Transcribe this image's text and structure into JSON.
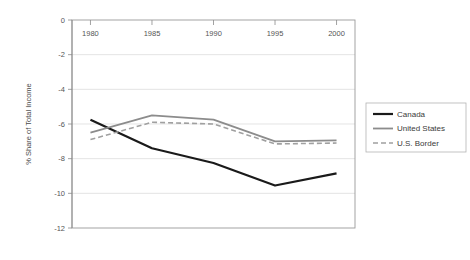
{
  "chart_data": {
    "type": "line",
    "title": "",
    "xlabel": "",
    "ylabel": "% Share of Total Income",
    "x": [
      1980,
      1985,
      1990,
      1995,
      2000
    ],
    "xtick_labels": [
      "1980",
      "1985",
      "1990",
      "1995",
      "2000"
    ],
    "ytick_labels": [
      "0",
      "-2",
      "-4",
      "-6",
      "-8",
      "-10",
      "-12"
    ],
    "ytick_values": [
      0,
      -2,
      -4,
      -6,
      -8,
      -10,
      -12
    ],
    "ylim": [
      -12,
      0
    ],
    "xlim": [
      1978.5,
      2001.5
    ],
    "grid": "horizontal",
    "legend_position": "right",
    "series": [
      {
        "name": "Canada",
        "values": [
          -5.75,
          -7.4,
          -8.25,
          -9.55,
          -8.85
        ],
        "color": "#1a1a1a",
        "style": "solid",
        "width": 2.2
      },
      {
        "name": "United States",
        "values": [
          -6.5,
          -5.5,
          -5.75,
          -7.0,
          -6.95
        ],
        "color": "#8c8c8c",
        "style": "solid",
        "width": 1.8
      },
      {
        "name": "U.S. Border",
        "values": [
          -6.9,
          -5.9,
          -6.0,
          -7.15,
          -7.1
        ],
        "color": "#a0a0a0",
        "style": "dashed",
        "width": 1.6
      }
    ]
  },
  "legend": {
    "items": [
      {
        "label": "Canada"
      },
      {
        "label": "United States"
      },
      {
        "label": "U.S. Border"
      }
    ]
  },
  "colors": {
    "canada": "#1a1a1a",
    "united_states": "#8c8c8c",
    "us_border": "#a0a0a0",
    "gridline": "#d9d9d9",
    "axis": "#8a8a8a",
    "text": "#555555",
    "background": "#ffffff"
  }
}
